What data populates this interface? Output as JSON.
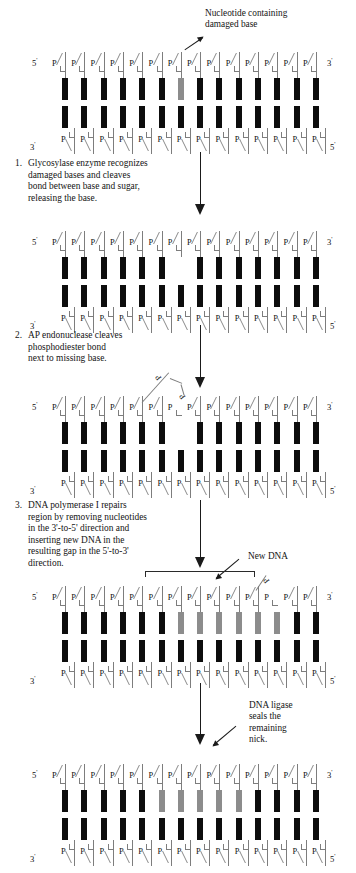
{
  "figure": {
    "callout_damaged": "Nucleotide containing\ndamaged base",
    "callout_damaged_line1": "Nucleotide containing",
    "callout_damaged_line2": "damaged base",
    "callout_new_dna": "New DNA",
    "callout_ligase_line1": "DNA ligase",
    "callout_ligase_line2": "seals the",
    "callout_ligase_line3": "remaining",
    "callout_ligase_line4": "nick."
  },
  "labels": {
    "five_prime": "5",
    "three_prime": "3",
    "prime_mark": "'",
    "phosphate": "P"
  },
  "steps": [
    {
      "number": "1.",
      "line1": "Glycosylase enzyme recognizes",
      "line2": "damaged bases and cleaves",
      "line3": "bond between base and sugar,",
      "line4": "releasing the base.",
      "text": "Glycosylase enzyme recognizes damaged bases and cleaves bond between base and sugar, releasing the base."
    },
    {
      "number": "2.",
      "line1": "AP endonuclease cleaves",
      "line2": "phosphodiester bond",
      "line3": "next to missing base.",
      "text": "AP endonuclease cleaves phosphodiester bond next to missing base."
    },
    {
      "number": "3.",
      "line1": "DNA polymerase I repairs",
      "line2": "region by removing nucleotides",
      "line3": "in the 3'-to-5' direction and",
      "line4": "inserting new DNA in the",
      "line5": "resulting gap in the 5'-to-3'",
      "line6": "direction.",
      "text": "DNA polymerase I repairs region by removing nucleotides in the 3'-to-5' direction and inserting new DNA in the resulting gap in the 5'-to-3' direction."
    }
  ],
  "colors": {
    "base_normal": "#0d0d0d",
    "base_damaged": "#8c8c8c",
    "base_new": "#8c8c8c",
    "backbone": "#7d7d7d",
    "text": "#141414",
    "arrow": "#1a1a1a"
  },
  "panels": [
    {
      "id": "panel-intact-damaged",
      "name": "Duplex with damaged base",
      "base_count": 14,
      "top_bases": [
        "normal",
        "normal",
        "normal",
        "normal",
        "normal",
        "normal",
        "damaged",
        "normal",
        "normal",
        "normal",
        "normal",
        "normal",
        "normal",
        "normal"
      ],
      "bottom_bases": [
        "normal",
        "normal",
        "normal",
        "normal",
        "normal",
        "normal",
        "normal",
        "normal",
        "normal",
        "normal",
        "normal",
        "normal",
        "normal",
        "normal"
      ],
      "top_backbone_gap": [],
      "top_left_label": "5",
      "top_right_label": "3",
      "bottom_left_label": "3",
      "bottom_right_label": "5"
    },
    {
      "id": "panel-base-removed",
      "name": "Base removed by glycosylase",
      "base_count": 14,
      "top_bases": [
        "normal",
        "normal",
        "normal",
        "normal",
        "normal",
        "normal",
        "missing",
        "normal",
        "normal",
        "normal",
        "normal",
        "normal",
        "normal",
        "normal"
      ],
      "bottom_bases": [
        "normal",
        "normal",
        "normal",
        "normal",
        "normal",
        "normal",
        "normal",
        "normal",
        "normal",
        "normal",
        "normal",
        "normal",
        "normal",
        "normal"
      ],
      "top_backbone_gap": [],
      "top_left_label": "5",
      "top_right_label": "3",
      "bottom_left_label": "3",
      "bottom_right_label": "5"
    },
    {
      "id": "panel-backbone-cleaved",
      "name": "Phosphodiester backbone cleaved",
      "base_count": 14,
      "top_bases": [
        "normal",
        "normal",
        "normal",
        "normal",
        "normal",
        "normal",
        "missing",
        "normal",
        "normal",
        "normal",
        "normal",
        "normal",
        "normal",
        "normal"
      ],
      "bottom_bases": [
        "normal",
        "normal",
        "normal",
        "normal",
        "normal",
        "normal",
        "normal",
        "normal",
        "normal",
        "normal",
        "normal",
        "normal",
        "normal",
        "normal"
      ],
      "top_backbone_gap": [
        6
      ],
      "top_left_label": "5",
      "top_right_label": "3",
      "bottom_left_label": "3",
      "bottom_right_label": "5"
    },
    {
      "id": "panel-new-dna",
      "name": "New DNA inserted by polymerase I",
      "base_count": 14,
      "top_bases": [
        "normal",
        "normal",
        "normal",
        "normal",
        "normal",
        "normal",
        "new",
        "new",
        "new",
        "new",
        "new",
        "new",
        "normal",
        "normal"
      ],
      "bottom_bases": [
        "normal",
        "normal",
        "normal",
        "normal",
        "normal",
        "normal",
        "normal",
        "normal",
        "normal",
        "normal",
        "normal",
        "normal",
        "normal",
        "normal"
      ],
      "top_backbone_gap": [
        11
      ],
      "top_left_label": "5",
      "top_right_label": "3",
      "bottom_left_label": "3",
      "bottom_right_label": "5"
    },
    {
      "id": "panel-sealed",
      "name": "Nick sealed by DNA ligase",
      "base_count": 14,
      "top_bases": [
        "normal",
        "normal",
        "normal",
        "normal",
        "normal",
        "new",
        "new",
        "new",
        "new",
        "new",
        "normal",
        "normal",
        "normal",
        "normal"
      ],
      "bottom_bases": [
        "normal",
        "normal",
        "normal",
        "normal",
        "normal",
        "normal",
        "normal",
        "normal",
        "normal",
        "normal",
        "normal",
        "normal",
        "normal",
        "normal"
      ],
      "top_backbone_gap": [],
      "top_left_label": "5",
      "top_right_label": "3",
      "bottom_left_label": "3",
      "bottom_right_label": "5"
    }
  ]
}
